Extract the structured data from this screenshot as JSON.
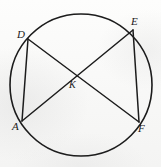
{
  "figure": {
    "background_color": "#fbfbfa",
    "ink_color": "#1c1c1c",
    "canvas": {
      "width": 161,
      "height": 167
    },
    "circle": {
      "center_x": 81,
      "center_y": 85,
      "radius": 71,
      "stroke_width": 1.6
    },
    "points": [
      {
        "id": "D",
        "label": "D",
        "x": 28,
        "y": 39,
        "label_x": 17,
        "label_y": 29
      },
      {
        "id": "E",
        "label": "E",
        "x": 133,
        "y": 30,
        "label_x": 131,
        "label_y": 16
      },
      {
        "id": "A",
        "label": "A",
        "x": 22,
        "y": 121,
        "label_x": 12,
        "label_y": 121
      },
      {
        "id": "F",
        "label": "F",
        "x": 139,
        "y": 122,
        "label_x": 138,
        "label_y": 123
      },
      {
        "id": "K",
        "label": "K",
        "x": 78,
        "y": 76,
        "label_x": 69,
        "label_y": 80
      }
    ],
    "chords": [
      {
        "id": "DA",
        "from": "D",
        "to": "A",
        "label": "chord D to A"
      },
      {
        "id": "EF",
        "from": "E",
        "to": "F",
        "label": "chord E to F"
      },
      {
        "id": "DF",
        "from": "D",
        "to": "F",
        "label": "chord D to F"
      },
      {
        "id": "AE",
        "from": "A",
        "to": "E",
        "label": "chord A to E"
      }
    ],
    "intersection": {
      "id": "K",
      "label": "K",
      "x": 78,
      "y": 76,
      "description": "intersection of chords D-F and A-E"
    }
  }
}
